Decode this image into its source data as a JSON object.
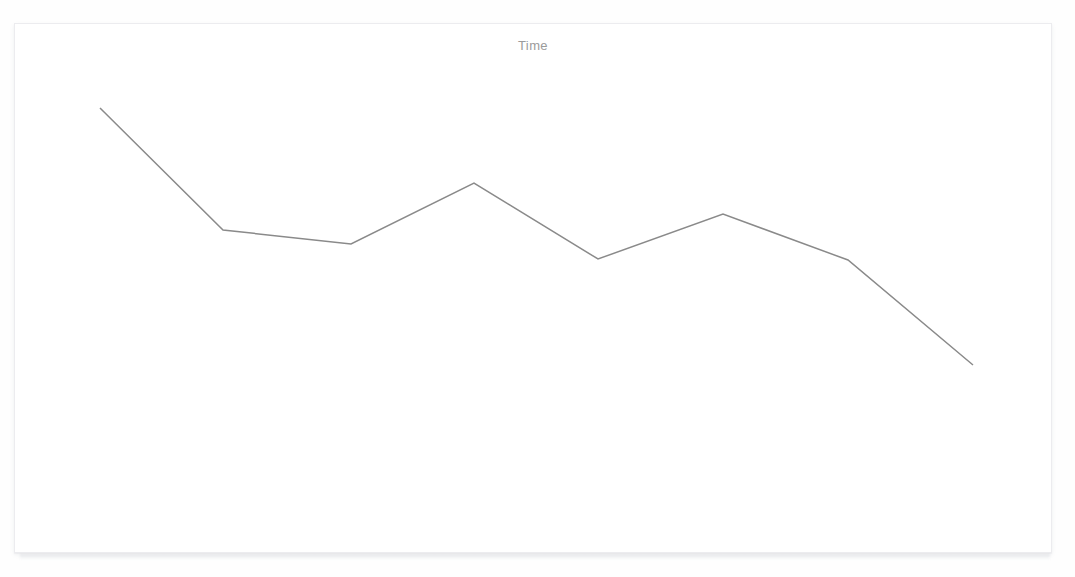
{
  "card": {
    "title": "Time",
    "title_color": "#9b9b9b",
    "background_color": "#ffffff",
    "border_color": "#ececef"
  },
  "page": {
    "background_color": "#fefefe"
  },
  "chart_data": {
    "type": "line",
    "title": "Time",
    "subtitle": "",
    "xlabel": "",
    "ylabel": "",
    "x": [
      0,
      1,
      2,
      3,
      4,
      5,
      6,
      7
    ],
    "categories": [
      "0",
      "1",
      "2",
      "3",
      "4",
      "5",
      "6",
      "7"
    ],
    "series": [
      {
        "name": "Time",
        "color": "#8a8a8a",
        "line_width": 1.5,
        "markers": false,
        "values": [
          100.0,
          52.9,
          47.5,
          71.0,
          41.7,
          59.1,
          41.3,
          0.0
        ]
      }
    ],
    "values": [
      100.0,
      52.9,
      47.5,
      71.0,
      41.7,
      59.1,
      41.3,
      0.0
    ],
    "pixel_points": [
      [
        99,
        107
      ],
      [
        222,
        229
      ],
      [
        350,
        243
      ],
      [
        473,
        182
      ],
      [
        597,
        258
      ],
      [
        722,
        213
      ],
      [
        847,
        259
      ],
      [
        972,
        364
      ]
    ],
    "xlim": [
      0,
      7
    ],
    "ylim": [
      0,
      100
    ],
    "grid": false,
    "axes_visible": false,
    "tick_labels_visible": false,
    "legend": false,
    "legend_position": "none"
  }
}
